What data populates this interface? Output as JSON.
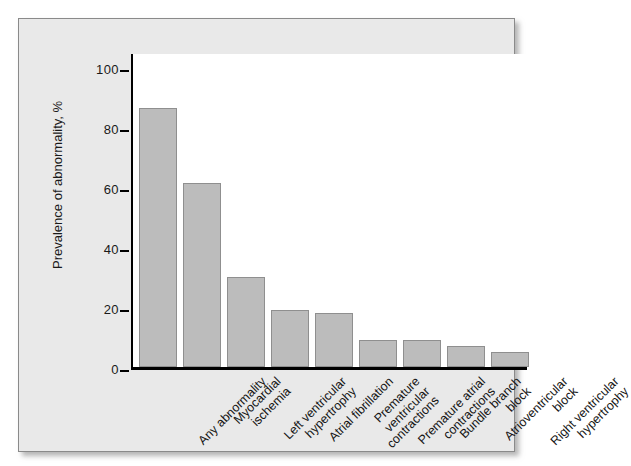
{
  "figure": {
    "background_color": "#ffffff",
    "panel_color": "#e9e9e9",
    "bar_color": "#bcbcbc",
    "bar_edge_color": "#8f8f8f",
    "axis_color": "#000000"
  },
  "chart_data": {
    "type": "bar",
    "title": "",
    "subtitle": "",
    "xlabel": "",
    "ylabel": "Prevalence of abnormality, %",
    "ylim": [
      0,
      105
    ],
    "yticks": [
      0,
      20,
      40,
      60,
      80,
      100
    ],
    "ytick_labels": [
      "0",
      "20",
      "40",
      "60",
      "80",
      "100"
    ],
    "grid": false,
    "legend": null,
    "categories": [
      "Any abnormality",
      "Myocardial ischemia",
      "Left ventricular hypertrophy",
      "Atrial fibrillation",
      "Premature ventricular contractions",
      "Premature atrial contractions",
      "Bundle branch block",
      "Atrioventricular block",
      "Right ventricular hypertrophy"
    ],
    "category_lines": [
      [
        "Any abnormality"
      ],
      [
        "Myocardial",
        "ischemia"
      ],
      [
        "Left ventricular",
        "hypertrophy"
      ],
      [
        "Atrial fibrillation"
      ],
      [
        "Premature",
        "ventricular",
        "contractions"
      ],
      [
        "Premature atrial",
        "contractions"
      ],
      [
        "Bundle branch",
        "block"
      ],
      [
        "Atrioventricular",
        "block"
      ],
      [
        "Right ventricular",
        "hypertrophy"
      ]
    ],
    "values": [
      86,
      61,
      30,
      19,
      18,
      9,
      9,
      7,
      5
    ],
    "value_unit": "%",
    "label_rotation": -45
  }
}
